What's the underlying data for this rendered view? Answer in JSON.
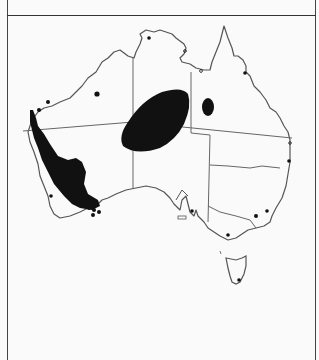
{
  "map": {
    "subject": "Distribution map of Australia",
    "region": "Australia",
    "colors": {
      "outline": "#555555",
      "fill_range": "#111111",
      "background": "#fafafa",
      "frame": "#444444"
    },
    "range_areas": [
      {
        "name": "western-australia-southwest-range",
        "description": "Large filled range along WA west coast from Shark Bay to south coast"
      },
      {
        "name": "central-australia-range",
        "description": "Large oval range spanning NT/SA/WA border region"
      },
      {
        "name": "queensland-west-range",
        "description": "Small oval range in western Queensland"
      }
    ],
    "point_records": [
      {
        "name": "kimberley-inland-record"
      },
      {
        "name": "pilbara-coast-records"
      },
      {
        "name": "wa-southwest-coast-record"
      },
      {
        "name": "wa-south-coast-cluster"
      },
      {
        "name": "darwin-record"
      },
      {
        "name": "qld-north-coast-record"
      },
      {
        "name": "qld-southeast-coast-record"
      },
      {
        "name": "adelaide-record"
      },
      {
        "name": "nsw-inland-record"
      },
      {
        "name": "nsw-coast-record"
      },
      {
        "name": "victoria-record"
      },
      {
        "name": "tasmania-record"
      }
    ]
  }
}
